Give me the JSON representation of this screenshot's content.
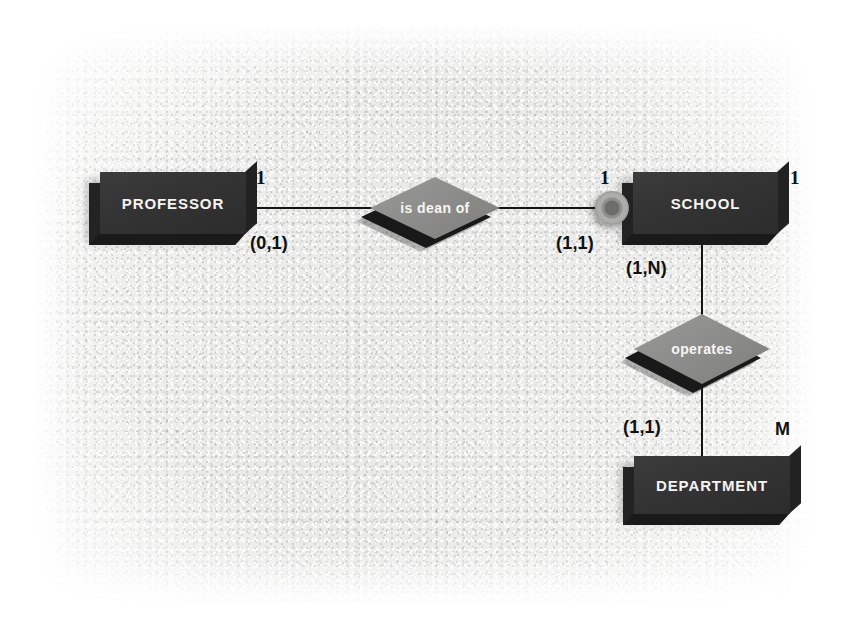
{
  "diagram": {
    "type": "entity-relationship",
    "notation": "Chen with (min,max) participation",
    "background_color": "#eeeeec",
    "entity_color": "#343434",
    "relationship_color": "#8d8d8b",
    "line_color": "#141414",
    "text_color": "#101010"
  },
  "entities": [
    {
      "id": "professor",
      "label": "PROFESSOR"
    },
    {
      "id": "school",
      "label": "SCHOOL"
    },
    {
      "id": "department",
      "label": "DEPARTMENT"
    }
  ],
  "relationships": [
    {
      "id": "is-dean-of",
      "label": "is dean of"
    },
    {
      "id": "operates",
      "label": "operates"
    }
  ],
  "connectors": [
    {
      "id": "school-ring",
      "kind": "ring-connector"
    }
  ],
  "cardinalities": {
    "professor_side_max": "1",
    "professor_side_minmax": "(0,1)",
    "school_left_max": "1",
    "school_left_minmax": "(1,1)",
    "school_right_max": "1",
    "school_down_minmax": "(1,N)",
    "department_up_minmax": "(1,1)",
    "department_max": "M"
  }
}
